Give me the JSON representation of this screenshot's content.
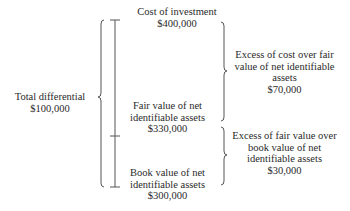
{
  "diagram": {
    "total_differential": {
      "label": "Total differential",
      "value": "$100,000"
    },
    "cost_of_investment": {
      "label": "Cost of investment",
      "value": "$400,000"
    },
    "fair_value": {
      "line1": "Fair value of net",
      "line2": "identifiable assets",
      "value": "$330,000"
    },
    "book_value": {
      "line1": "Book value of net",
      "line2": "identifiable assets",
      "value": "$300,000"
    },
    "excess_cost_over_fair": {
      "line1": "Excess of cost over fair",
      "line2": "value of net identifiable",
      "line3": "assets",
      "value": "$70,000"
    },
    "excess_fair_over_book": {
      "line1": "Excess of fair value over",
      "line2": "book value of net",
      "line3": "identifiable assets",
      "value": "$30,000"
    }
  }
}
